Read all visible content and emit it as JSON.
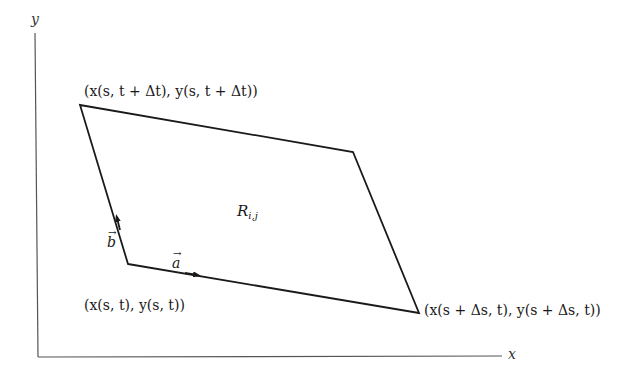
{
  "diagram": {
    "axes": {
      "x_label": "x",
      "y_label": "y",
      "color": "#555555"
    },
    "parallelogram": {
      "vertices": {
        "bottom_left": [
          128,
          264
        ],
        "bottom_right": [
          419,
          313
        ],
        "top_right": [
          353,
          152
        ],
        "top_left": [
          80,
          105
        ]
      },
      "stroke": "#1a1a1a"
    },
    "region_label": {
      "base": "R",
      "subscript": "i,j"
    },
    "vectors": {
      "a": {
        "label": "a",
        "arrow": "→"
      },
      "b": {
        "label": "b",
        "arrow": "→"
      }
    },
    "point_labels": {
      "origin": "(x(s, t), y(s, t))",
      "top_left": "(x(s, t + Δt), y(s, t + Δt))",
      "bottom_right": "(x(s + Δs, t), y(s + Δs, t))"
    }
  }
}
